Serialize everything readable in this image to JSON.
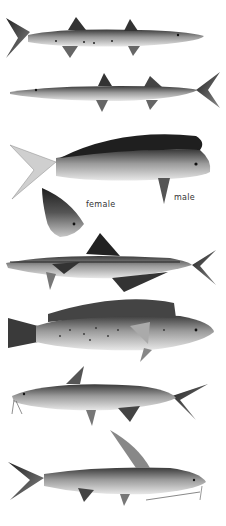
{
  "plate": {
    "background": "#ffffff",
    "fish_count": 8
  },
  "figures": [
    {
      "id": "barracuda-1",
      "facing": "right"
    },
    {
      "id": "barracuda-2",
      "facing": "left"
    },
    {
      "id": "dolphinfish-male",
      "facing": "right"
    },
    {
      "id": "dolphinfish-female-head",
      "facing": "right"
    },
    {
      "id": "cobia",
      "facing": "left"
    },
    {
      "id": "seatrout",
      "facing": "right"
    },
    {
      "id": "catfish-1",
      "facing": "left"
    },
    {
      "id": "catfish-2",
      "facing": "right"
    }
  ],
  "labels": {
    "female": "female",
    "male": "male"
  },
  "colors": {
    "dark": "#2a2a2a",
    "mid": "#7a7a7a",
    "light": "#d8d8d8"
  }
}
